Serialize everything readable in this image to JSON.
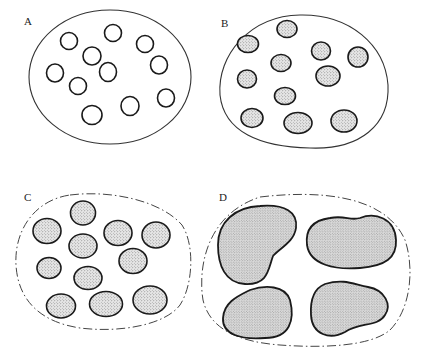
{
  "diagram": {
    "type": "schematic cell-aggregation stages",
    "panels": [
      {
        "id": "A",
        "label": "A",
        "outline": {
          "style": "solid",
          "cx": 110,
          "cy": 77,
          "rx": 81,
          "ry": 67
        },
        "inclusions": {
          "count": 11,
          "fill": "empty",
          "items": [
            {
              "cx": 69,
              "cy": 41,
              "rx": 8.5,
              "ry": 8.5
            },
            {
              "cx": 113,
              "cy": 33,
              "rx": 8.5,
              "ry": 8.5
            },
            {
              "cx": 145,
              "cy": 44,
              "rx": 8.5,
              "ry": 8.5
            },
            {
              "cx": 92,
              "cy": 56,
              "rx": 9,
              "ry": 9
            },
            {
              "cx": 108,
              "cy": 72,
              "rx": 8.5,
              "ry": 9.5
            },
            {
              "cx": 159,
              "cy": 65,
              "rx": 8.5,
              "ry": 9
            },
            {
              "cx": 55,
              "cy": 73,
              "rx": 8.5,
              "ry": 9
            },
            {
              "cx": 78,
              "cy": 86,
              "rx": 8.5,
              "ry": 8.5
            },
            {
              "cx": 166,
              "cy": 98,
              "rx": 8.5,
              "ry": 9
            },
            {
              "cx": 130,
              "cy": 106,
              "rx": 9,
              "ry": 9.5
            },
            {
              "cx": 92,
              "cy": 115,
              "rx": 10,
              "ry": 9.5
            }
          ]
        }
      },
      {
        "id": "B",
        "label": "B",
        "outline": {
          "style": "solid",
          "cx": 304,
          "cy": 82,
          "rx": 84,
          "ry": 67
        },
        "inclusions": {
          "count": 11,
          "fill": "stippled",
          "items": [
            {
              "cx": 248,
              "cy": 44,
              "rx": 10.5,
              "ry": 8.5
            },
            {
              "cx": 287,
              "cy": 29,
              "rx": 10,
              "ry": 8.5
            },
            {
              "cx": 321,
              "cy": 51,
              "rx": 9.5,
              "ry": 9
            },
            {
              "cx": 358,
              "cy": 57,
              "rx": 10,
              "ry": 10
            },
            {
              "cx": 281,
              "cy": 63,
              "rx": 10,
              "ry": 8.5
            },
            {
              "cx": 247,
              "cy": 79,
              "rx": 9.5,
              "ry": 9
            },
            {
              "cx": 328,
              "cy": 76,
              "rx": 12,
              "ry": 10
            },
            {
              "cx": 285,
              "cy": 96,
              "rx": 10.5,
              "ry": 8.5
            },
            {
              "cx": 252,
              "cy": 118,
              "rx": 11,
              "ry": 9.5
            },
            {
              "cx": 298,
              "cy": 123,
              "rx": 14,
              "ry": 10.5
            },
            {
              "cx": 344,
              "cy": 121,
              "rx": 13,
              "ry": 11
            }
          ]
        }
      },
      {
        "id": "C",
        "label": "C",
        "outline": {
          "style": "dash-dot",
          "cx": 104,
          "cy": 262,
          "rx": 89,
          "ry": 69
        },
        "inclusions": {
          "count": 11,
          "fill": "stippled-dense",
          "items": [
            {
              "cx": 83,
              "cy": 213,
              "rx": 12.5,
              "ry": 12
            },
            {
              "cx": 47,
              "cy": 231,
              "rx": 14,
              "ry": 12.5
            },
            {
              "cx": 118,
              "cy": 233,
              "rx": 14,
              "ry": 12.5
            },
            {
              "cx": 156,
              "cy": 235,
              "rx": 14,
              "ry": 13
            },
            {
              "cx": 83,
              "cy": 246,
              "rx": 14,
              "ry": 12
            },
            {
              "cx": 49,
              "cy": 268,
              "rx": 12,
              "ry": 10.5
            },
            {
              "cx": 133,
              "cy": 261,
              "rx": 14,
              "ry": 12.5
            },
            {
              "cx": 88,
              "cy": 278,
              "rx": 14,
              "ry": 11.5
            },
            {
              "cx": 61,
              "cy": 306,
              "rx": 14.5,
              "ry": 12
            },
            {
              "cx": 106,
              "cy": 304,
              "rx": 16.5,
              "ry": 12.5
            },
            {
              "cx": 150,
              "cy": 300,
              "rx": 17,
              "ry": 14
            }
          ]
        }
      },
      {
        "id": "D",
        "label": "D",
        "outline": {
          "style": "dash-dot",
          "cx": 307,
          "cy": 270,
          "rx": 106,
          "ry": 76
        },
        "inclusions": {
          "count": 4,
          "fill": "stippled-dense",
          "items": [
            {
              "position": "top-left"
            },
            {
              "position": "top-right"
            },
            {
              "position": "bottom-left"
            },
            {
              "position": "bottom-right"
            }
          ]
        }
      }
    ],
    "colors": {
      "background": "#ffffff",
      "stroke": "#1a1a1a",
      "stipple_fill": "#d9d9d9",
      "stipple_dot": "#555555"
    }
  }
}
